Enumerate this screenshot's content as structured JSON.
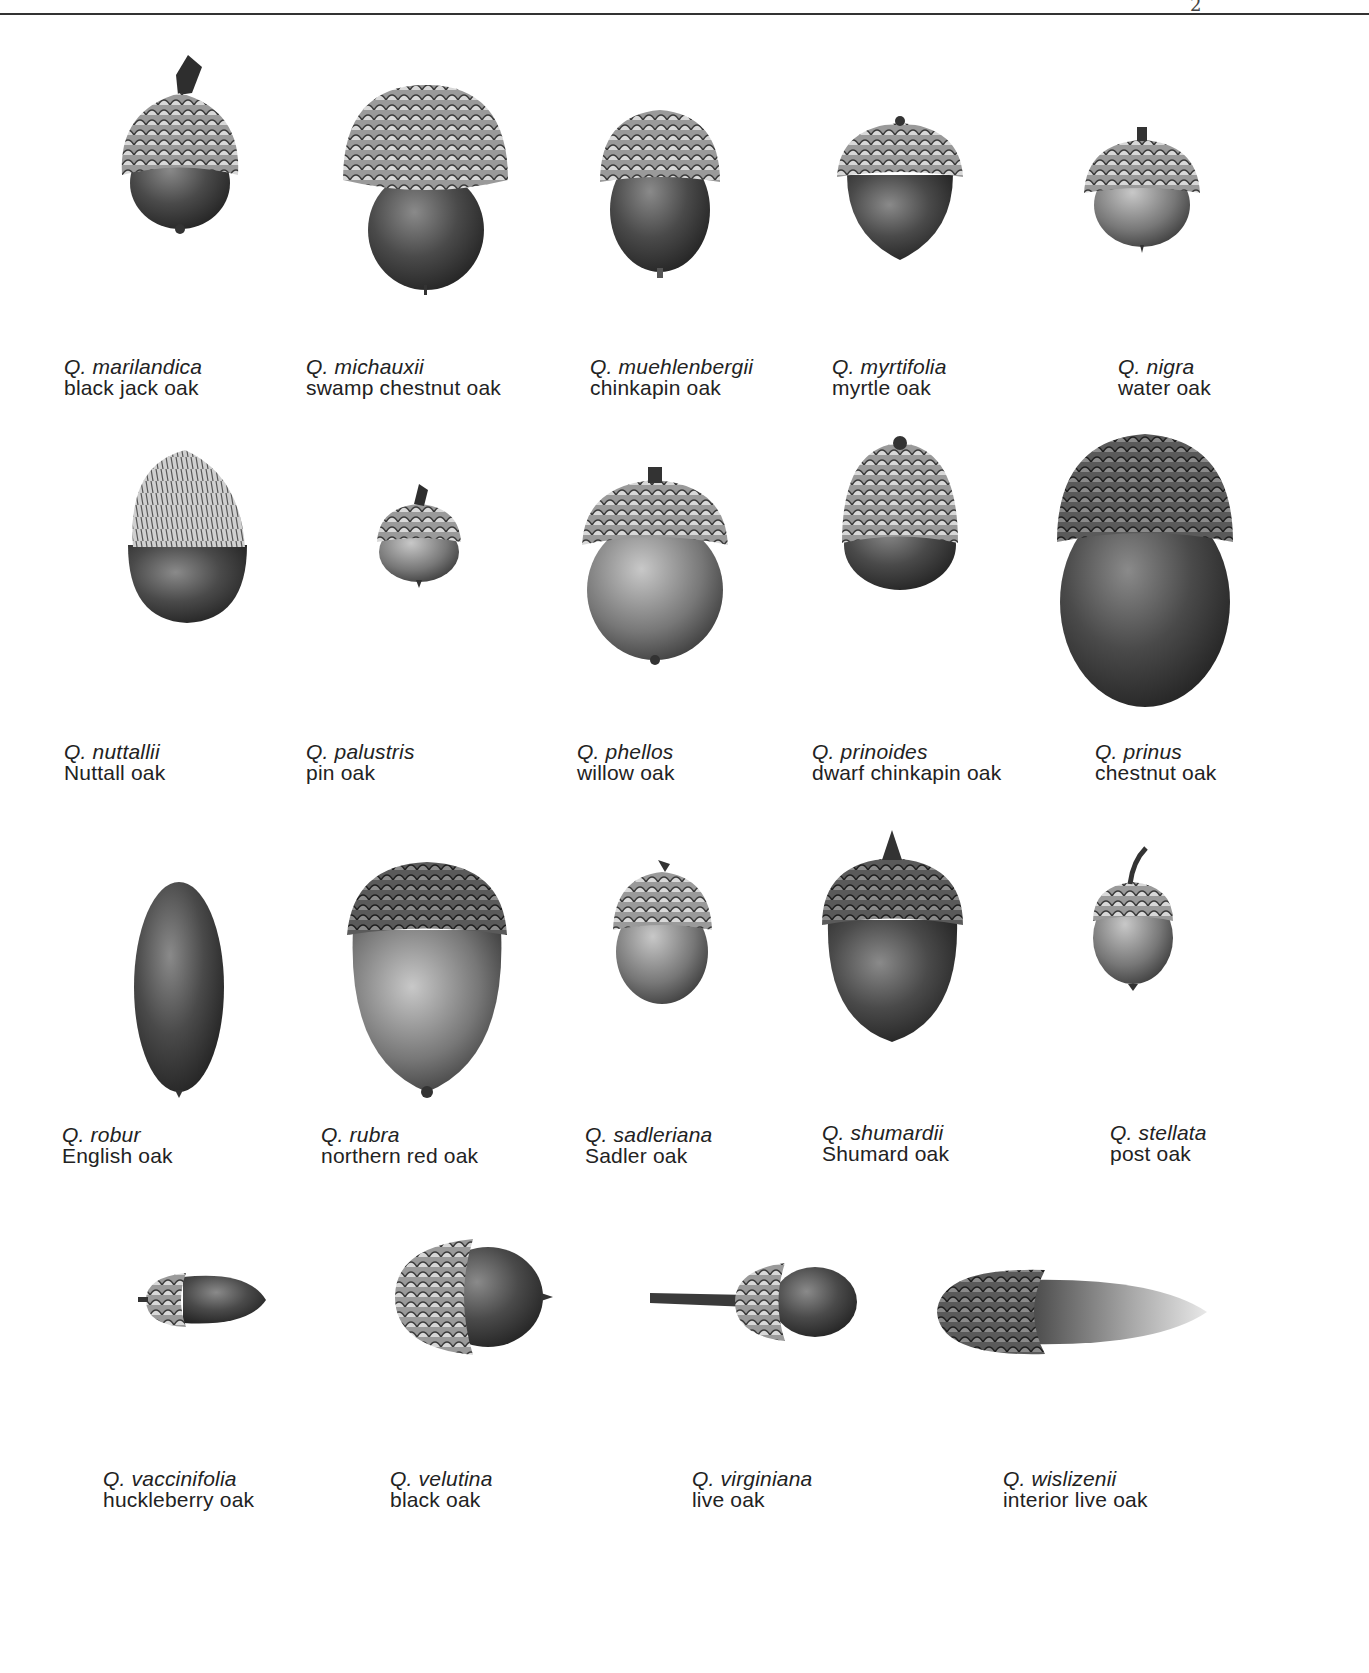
{
  "page": {
    "page_mark": "2"
  },
  "specimens": [
    {
      "scientific": "Q. marilandica",
      "common": "black jack oak"
    },
    {
      "scientific": "Q. michauxii",
      "common": "swamp chestnut oak"
    },
    {
      "scientific": "Q. muehlenbergii",
      "common": "chinkapin oak"
    },
    {
      "scientific": "Q. myrtifolia",
      "common": "myrtle oak"
    },
    {
      "scientific": "Q. nigra",
      "common": "water oak"
    },
    {
      "scientific": "Q. nuttallii",
      "common": "Nuttall oak"
    },
    {
      "scientific": "Q. palustris",
      "common": "pin oak"
    },
    {
      "scientific": "Q. phellos",
      "common": "willow oak"
    },
    {
      "scientific": "Q. prinoides",
      "common": "dwarf chinkapin oak"
    },
    {
      "scientific": "Q. prinus",
      "common": "chestnut oak"
    },
    {
      "scientific": "Q. robur",
      "common": "English oak"
    },
    {
      "scientific": "Q. rubra",
      "common": "northern red oak"
    },
    {
      "scientific": "Q. sadleriana",
      "common": "Sadler oak"
    },
    {
      "scientific": "Q. shumardii",
      "common": "Shumard oak"
    },
    {
      "scientific": "Q. stellata",
      "common": "post oak"
    },
    {
      "scientific": "Q. vaccinifolia",
      "common": "huckleberry oak"
    },
    {
      "scientific": "Q. velutina",
      "common": "black oak"
    },
    {
      "scientific": "Q. virginiana",
      "common": "live oak"
    },
    {
      "scientific": "Q. wislizenii",
      "common": "interior live oak"
    }
  ]
}
